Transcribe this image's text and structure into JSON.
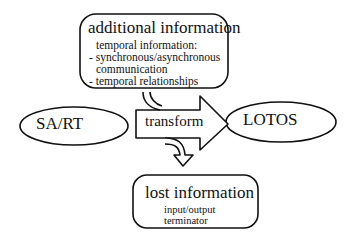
{
  "nodes": {
    "additional": {
      "title": "additional information",
      "lines": [
        "temporal information:",
        "- synchronous/asynchronous",
        "  communication",
        "- temporal relationships"
      ]
    },
    "source": {
      "label": "SA/RT"
    },
    "target": {
      "label": "LOTOS"
    },
    "transform": {
      "label": "transform"
    },
    "lost": {
      "title": "lost information",
      "lines": [
        "input/output",
        "terminator"
      ]
    }
  },
  "edges": [
    {
      "from": "additional",
      "to": "transform",
      "kind": "curved-input-arrow"
    },
    {
      "from": "source",
      "to": "target",
      "kind": "block-arrow",
      "label": "transform"
    },
    {
      "from": "transform",
      "to": "lost",
      "kind": "curved-output-arrow"
    }
  ]
}
